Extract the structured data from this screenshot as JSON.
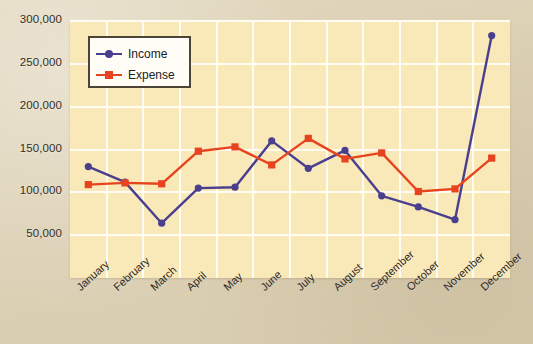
{
  "chart_data": {
    "type": "line",
    "title": "",
    "xlabel": "",
    "ylabel": "",
    "grid": true,
    "legend_position": "top-left-inside",
    "categories": [
      "January",
      "February",
      "March",
      "April",
      "May",
      "June",
      "July",
      "August",
      "September",
      "October",
      "November",
      "December"
    ],
    "ylim": [
      0,
      300000
    ],
    "yticks": [
      50000,
      100000,
      150000,
      200000,
      250000,
      300000
    ],
    "ytick_labels": [
      "50,000",
      "100,000",
      "150,000",
      "200,000",
      "250,000",
      "300,000"
    ],
    "series": [
      {
        "name": "Income",
        "color": "#4a3f8f",
        "marker": "circle",
        "values": [
          130000,
          112000,
          64000,
          105000,
          106000,
          160000,
          128000,
          149000,
          96000,
          83000,
          68000,
          283000
        ]
      },
      {
        "name": "Expense",
        "color": "#e8431f",
        "marker": "square",
        "values": [
          109000,
          111000,
          110000,
          148000,
          153000,
          132000,
          163000,
          139000,
          146000,
          101000,
          104000,
          140000
        ]
      }
    ]
  },
  "legend": {
    "items": [
      {
        "label": "Income",
        "color": "#4a3f8f"
      },
      {
        "label": "Expense",
        "color": "#e8431f"
      }
    ]
  },
  "axes": {
    "y_tick_labels": [
      "300,000",
      "250,000",
      "200,000",
      "150,000",
      "100,000",
      "50,000"
    ],
    "x_tick_labels": [
      "January",
      "February",
      "March",
      "April",
      "May",
      "June",
      "July",
      "August",
      "September",
      "October",
      "November",
      "December"
    ]
  },
  "colors": {
    "page_background": "#ded3b8",
    "plot_background": "#fae9b8",
    "gridline": "#fffdf3",
    "income": "#4a3f8f",
    "expense": "#e8431f",
    "legend_border": "#4d4436",
    "text": "#2e281d"
  }
}
